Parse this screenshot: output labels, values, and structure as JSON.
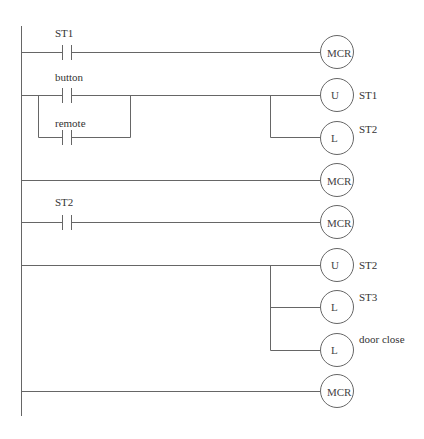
{
  "diagram": {
    "type": "ladder-logic",
    "rungs": [
      {
        "contacts": [
          "ST1"
        ],
        "coils": [
          {
            "symbol": "MCR",
            "label": ""
          }
        ]
      },
      {
        "contacts": [
          "button",
          "remote"
        ],
        "contacts_arrangement": "parallel",
        "coils": [
          {
            "symbol": "U",
            "label": "ST1"
          },
          {
            "symbol": "L",
            "label": "ST2"
          }
        ]
      },
      {
        "contacts": [],
        "coils": [
          {
            "symbol": "MCR",
            "label": ""
          }
        ]
      },
      {
        "contacts": [
          "ST2"
        ],
        "coils": [
          {
            "symbol": "MCR",
            "label": ""
          }
        ]
      },
      {
        "contacts": [],
        "coils": [
          {
            "symbol": "U",
            "label": "ST2"
          },
          {
            "symbol": "L",
            "label": "ST3"
          },
          {
            "symbol": "L",
            "label": "door close"
          }
        ]
      },
      {
        "contacts": [],
        "coils": [
          {
            "symbol": "MCR",
            "label": ""
          }
        ]
      }
    ]
  },
  "labels": {
    "c_st1": "ST1",
    "c_button": "button",
    "c_remote": "remote",
    "c_st2": "ST2",
    "coil1": "MCR",
    "coil2": "U",
    "coil2_tag": "ST1",
    "coil3": "L",
    "coil3_tag": "ST2",
    "coil4": "MCR",
    "coil5": "MCR",
    "coil6": "U",
    "coil6_tag": "ST2",
    "coil7": "L",
    "coil7_tag": "ST3",
    "coil8": "L",
    "coil8_tag": "door close",
    "coil9": "MCR"
  }
}
